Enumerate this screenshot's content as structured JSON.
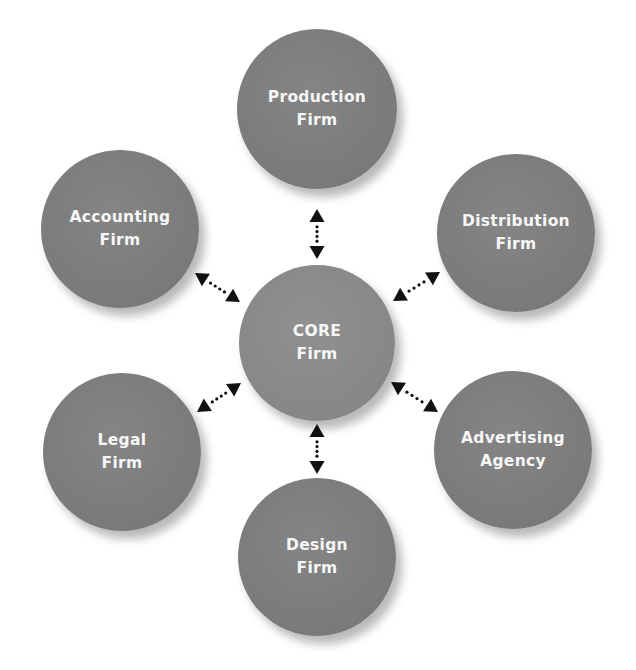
{
  "diagram": {
    "title": "",
    "colors": {
      "node_fill": "#7b7b7b",
      "core_fill": "#878787",
      "node_text": "#f7f7f7",
      "arrow": "#111111",
      "background": "#ffffff"
    },
    "core": {
      "id": "core",
      "line1": "CORE",
      "line2": "Firm",
      "cx": 317,
      "cy": 343,
      "r": 78
    },
    "partners": [
      {
        "id": "production",
        "line1": "Production",
        "line2": "Firm",
        "cx": 317,
        "cy": 109,
        "r": 80
      },
      {
        "id": "distribution",
        "line1": "Distribution",
        "line2": "Firm",
        "cx": 516,
        "cy": 233,
        "r": 79
      },
      {
        "id": "advertising",
        "line1": "Advertising",
        "line2": "Agency",
        "cx": 513,
        "cy": 450,
        "r": 79
      },
      {
        "id": "design",
        "line1": "Design",
        "line2": "Firm",
        "cx": 317,
        "cy": 557,
        "r": 79
      },
      {
        "id": "legal",
        "line1": "Legal",
        "line2": "Firm",
        "cx": 122,
        "cy": 452,
        "r": 79
      },
      {
        "id": "accounting",
        "line1": "Accounting",
        "line2": "Firm",
        "cx": 120,
        "cy": 229,
        "r": 79
      }
    ],
    "connections": [
      {
        "from": "core",
        "to": "production",
        "type": "bidirectional-dotted",
        "x1": 317,
        "y1": 259,
        "x2": 317,
        "y2": 209
      },
      {
        "from": "core",
        "to": "distribution",
        "type": "bidirectional-dotted",
        "x1": 393,
        "y1": 301,
        "x2": 440,
        "y2": 272
      },
      {
        "from": "core",
        "to": "advertising",
        "type": "bidirectional-dotted",
        "x1": 391,
        "y1": 382,
        "x2": 438,
        "y2": 412
      },
      {
        "from": "core",
        "to": "design",
        "type": "bidirectional-dotted",
        "x1": 317,
        "y1": 424,
        "x2": 317,
        "y2": 474
      },
      {
        "from": "core",
        "to": "legal",
        "type": "bidirectional-dotted",
        "x1": 241,
        "y1": 383,
        "x2": 197,
        "y2": 412
      },
      {
        "from": "core",
        "to": "accounting",
        "type": "bidirectional-dotted",
        "x1": 240,
        "y1": 302,
        "x2": 195,
        "y2": 273
      }
    ]
  }
}
